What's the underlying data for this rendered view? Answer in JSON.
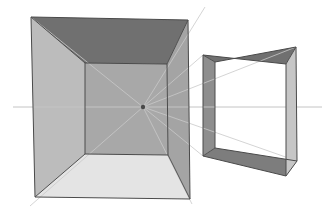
{
  "canvas": {
    "width": 328,
    "height": 215,
    "background": "#ffffff",
    "title": "One-point perspective box construction"
  },
  "palette": {
    "background": "#ffffff",
    "ceiling_dark": "#6f6f6f",
    "wall_left_light": "#bcbcbc",
    "wall_back_mid": "#a8a8a8",
    "wall_right_mid": "#a4a4a4",
    "floor_pale": "#e4e4e4",
    "small_left_face": "#8e8e8e",
    "small_top_face": "#6f6f6f",
    "small_right_face": "#c6c6c6",
    "small_bottom_face": "#7d7d7d",
    "small_interior": "#ffffff",
    "outline_dark": "#4a4a4a",
    "construction_line": "#c9c9c9",
    "horizon_line": "#c4c4c4",
    "vanishing_point": "#4a4a4a"
  },
  "scene": {
    "label": "perspective-study",
    "vanishing_point": {
      "x": 143,
      "y": 107,
      "label": "VP"
    },
    "horizon": {
      "y": 107,
      "x_start": 13,
      "x_end": 322,
      "label": "horizon line"
    },
    "objects": [
      {
        "name": "large-box",
        "type": "interior-room",
        "faces": 5
      },
      {
        "name": "small-box",
        "type": "open-box",
        "faces": 4
      }
    ]
  },
  "large_box": {
    "name": "large-box",
    "outer": {
      "top_left": {
        "x": 31,
        "y": 17
      },
      "top_right": {
        "x": 188,
        "y": 20
      },
      "bottom_right": {
        "x": 190,
        "y": 199
      },
      "bottom_left": {
        "x": 35,
        "y": 197
      }
    },
    "inner": {
      "top_left": {
        "x": 85,
        "y": 63
      },
      "top_right": {
        "x": 167,
        "y": 64
      },
      "bottom_right": {
        "x": 168,
        "y": 155
      },
      "bottom_left": {
        "x": 85,
        "y": 154
      }
    },
    "faces": [
      {
        "name": "ceiling",
        "fill": "#6f6f6f"
      },
      {
        "name": "left-wall",
        "fill": "#bcbcbc"
      },
      {
        "name": "right-wall",
        "fill": "#a4a4a4"
      },
      {
        "name": "floor",
        "fill": "#e4e4e4"
      },
      {
        "name": "back-wall",
        "fill": "#a8a8a8"
      }
    ]
  },
  "small_box": {
    "name": "small-box",
    "front": {
      "top_left": {
        "x": 203,
        "y": 55
      },
      "top_right": {
        "x": 286,
        "y": 64
      },
      "bottom_right": {
        "x": 286,
        "y": 176
      },
      "bottom_left": {
        "x": 203,
        "y": 156
      }
    },
    "back": {
      "top_left": {
        "x": 215,
        "y": 62
      },
      "top_right": {
        "x": 296,
        "y": 47
      },
      "bottom_right": {
        "x": 297,
        "y": 161
      },
      "bottom_left": {
        "x": 215,
        "y": 148
      }
    },
    "faces": [
      {
        "name": "left-face",
        "fill": "#8e8e8e"
      },
      {
        "name": "top-face",
        "fill": "#6f6f6f"
      },
      {
        "name": "bottom-face",
        "fill": "#7d7d7d"
      },
      {
        "name": "right-face",
        "fill": "#c6c6c6"
      },
      {
        "name": "interior",
        "fill": "#ffffff"
      }
    ]
  },
  "construction_lines": [
    {
      "name": "vp-to-large-top-left",
      "x1": 143,
      "y1": 107,
      "x2": 31,
      "y2": 17
    },
    {
      "name": "vp-to-large-top-right",
      "x1": 143,
      "y1": 107,
      "x2": 188,
      "y2": 20
    },
    {
      "name": "vp-to-large-bottom-right",
      "x1": 143,
      "y1": 107,
      "x2": 190,
      "y2": 199
    },
    {
      "name": "vp-to-large-bottom-left",
      "x1": 143,
      "y1": 107,
      "x2": 35,
      "y2": 197
    },
    {
      "name": "vp-to-small-top-left",
      "x1": 143,
      "y1": 107,
      "x2": 203,
      "y2": 55
    },
    {
      "name": "vp-to-small-bottom-left",
      "x1": 143,
      "y1": 107,
      "x2": 203,
      "y2": 156
    },
    {
      "name": "vp-extend-small-top-right",
      "x1": 143,
      "y1": 107,
      "x2": 296,
      "y2": 47
    },
    {
      "name": "vp-extend-small-bottom-right",
      "x1": 143,
      "y1": 107,
      "x2": 297,
      "y2": 161
    },
    {
      "name": "ray-up-right-past-corner",
      "x1": 143,
      "y1": 107,
      "x2": 205,
      "y2": 7
    },
    {
      "name": "ray-left-down",
      "x1": 143,
      "y1": 107,
      "x2": 30,
      "y2": 206
    }
  ]
}
